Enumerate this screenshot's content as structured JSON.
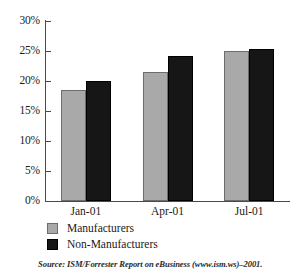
{
  "chart_data": {
    "type": "bar",
    "title": "",
    "subtitle": "",
    "xlabel": "",
    "ylabel": "",
    "categories": [
      "Jan-01",
      "Apr-01",
      "Jul-01"
    ],
    "series": [
      {
        "name": "Manufacturers",
        "color": "#a9a9a9",
        "values": [
          18.5,
          21.5,
          25.0
        ]
      },
      {
        "name": "Non-Manufacturers",
        "color": "#161616",
        "values": [
          20.0,
          24.2,
          25.3
        ]
      }
    ],
    "ylim": [
      0,
      30
    ],
    "ytick_values": [
      30,
      25,
      20,
      15,
      10,
      5,
      0
    ],
    "ytick_labels": [
      "30%",
      "25%",
      "20%",
      "15%",
      "10%",
      "5%",
      "0%"
    ],
    "grid": false,
    "legend_position": "below-left",
    "value_unit": "%"
  },
  "legend": {
    "items": [
      {
        "label": "Manufacturers",
        "swatch": "gray-swatch"
      },
      {
        "label": "Non-Manufacturers",
        "swatch": "black-swatch"
      }
    ]
  },
  "source": {
    "text": "Source: ISM/Forrester Report on eBusiness (www.ism.ws)–2001."
  }
}
